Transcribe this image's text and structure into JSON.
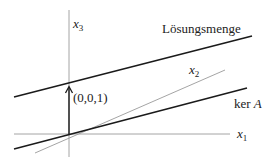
{
  "diagram": {
    "axes": {
      "x1": {
        "label": "x",
        "sub": "1"
      },
      "x2": {
        "label": "x",
        "sub": "2"
      },
      "x3": {
        "label": "x",
        "sub": "3"
      }
    },
    "vector": {
      "label": "(0,0,1)"
    },
    "lines": {
      "solution_set": {
        "label": "Lösungsmenge"
      },
      "kernel": {
        "label_prefix": "ker ",
        "label_var": "A"
      }
    },
    "colors": {
      "thick_line": "#1a1a1a",
      "thin_line": "#8a8a8a",
      "axis": "#9a9a9a"
    }
  }
}
